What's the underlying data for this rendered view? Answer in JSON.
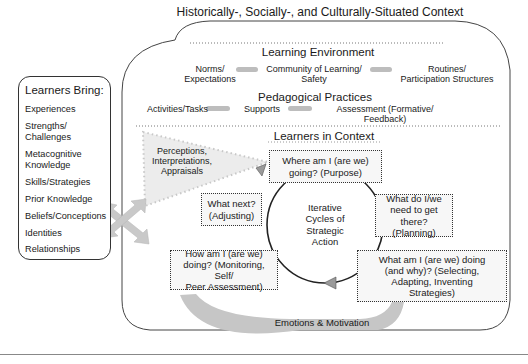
{
  "diagram": {
    "outer_context": {
      "title": "Historically-, Socially-, and Culturally-Situated Context"
    },
    "learning_environment": {
      "heading": "Learning Environment",
      "left": [
        "Norms/",
        "Expectations"
      ],
      "center": [
        "Community of Learning/",
        "Safety"
      ],
      "right": [
        "Routines/",
        "Participation Structures"
      ]
    },
    "pedagogical_practices": {
      "heading": "Pedagogical Practices",
      "left": "Activities/Tasks",
      "center": "Supports",
      "right": [
        "Assessment (Formative/",
        "Feedback)"
      ]
    },
    "learners_bring": {
      "title": "Learners Bring:",
      "items": [
        [
          "Experiences"
        ],
        [
          "Strengths/",
          "Challenges"
        ],
        [
          "Metacognitive",
          "Knowledge"
        ],
        [
          "Skills/Strategies"
        ],
        [
          "Prior Knowledge"
        ],
        [
          "Beliefs/Conceptions"
        ],
        [
          "Identities"
        ],
        [
          "Relationships"
        ]
      ]
    },
    "perceptions": [
      "Perceptions,",
      "Interpretations,",
      "Appraisals"
    ],
    "learners_in_context": {
      "heading": "Learners in Context",
      "center": [
        "Iterative",
        "Cycles of",
        "Strategic",
        "Action"
      ],
      "steps": [
        {
          "id": "purpose",
          "lines": [
            "Where am I (are we)",
            "going? (Purpose)"
          ]
        },
        {
          "id": "planning",
          "lines": [
            "What do I/we",
            "need to get",
            "there? (Planning)"
          ]
        },
        {
          "id": "selecting",
          "lines": [
            "What am I (are we) doing",
            "(and why)? (Selecting,",
            "Adapting, Inventing",
            "Strategies)"
          ]
        },
        {
          "id": "monitoring",
          "lines": [
            "How am I (are we)",
            "doing? (Monitoring, Self/",
            "Peer Assessment)"
          ]
        },
        {
          "id": "adjusting",
          "lines": [
            "What next?",
            "(Adjusting)"
          ]
        }
      ]
    },
    "emotions_band": "Emotions & Motivation",
    "colors": {
      "line": "#333333",
      "arrow_gray": "#b5b5b5",
      "band_gray": "#c4c4c4",
      "box_fill": "#f7f7f7",
      "perception_fill": "#ebebeb"
    }
  }
}
